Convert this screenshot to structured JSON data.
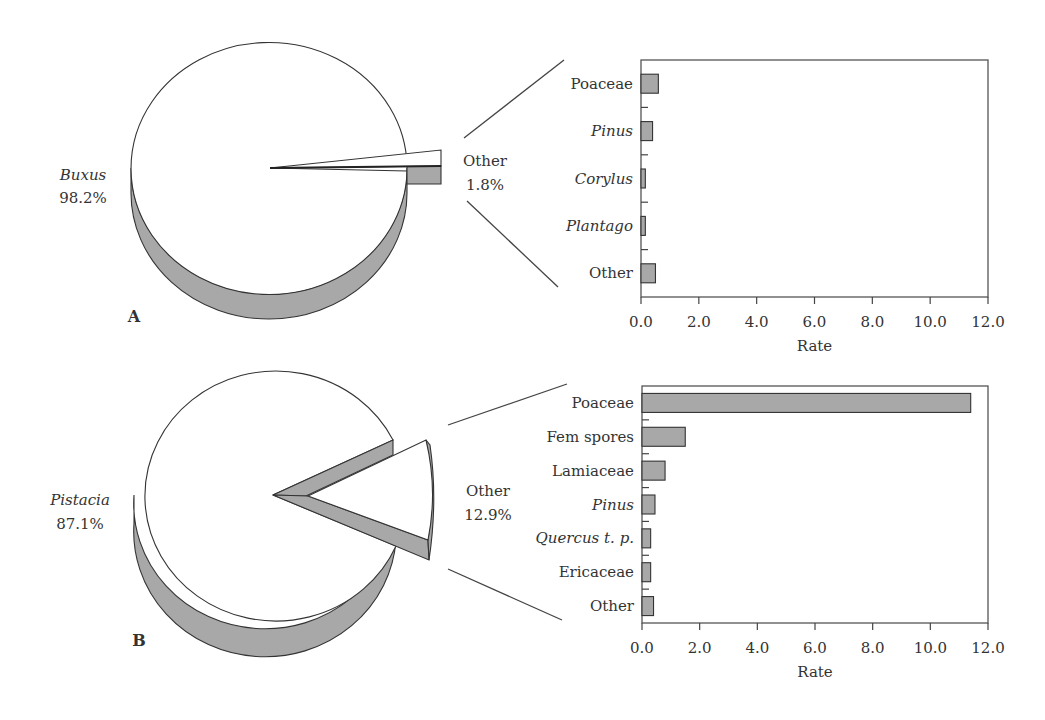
{
  "figure": {
    "panels": [
      {
        "letter": "A",
        "pie": {
          "main_label": "Buxus",
          "main_pct": "98.2%",
          "other_label": "Other",
          "other_pct": "1.8%"
        },
        "bar": {
          "xlabel": "Rate",
          "ticks": [
            "0.0",
            "2.0",
            "4.0",
            "6.0",
            "8.0",
            "10.0",
            "12.0"
          ],
          "categories": [
            {
              "label": "Poaceae",
              "italic": false,
              "value": 0.6
            },
            {
              "label": "Pinus",
              "italic": true,
              "value": 0.4
            },
            {
              "label": "Corylus",
              "italic": true,
              "value": 0.15
            },
            {
              "label": "Plantago",
              "italic": true,
              "value": 0.15
            },
            {
              "label": "Other",
              "italic": false,
              "value": 0.5
            }
          ]
        }
      },
      {
        "letter": "B",
        "pie": {
          "main_label": "Pistacia",
          "main_pct": "87.1%",
          "other_label": "Other",
          "other_pct": "12.9%"
        },
        "bar": {
          "xlabel": "Rate",
          "ticks": [
            "0.0",
            "2.0",
            "4.0",
            "6.0",
            "8.0",
            "10.0",
            "12.0"
          ],
          "categories": [
            {
              "label": "Poaceae",
              "italic": false,
              "value": 11.4
            },
            {
              "label": "Fem spores",
              "italic": false,
              "value": 1.5
            },
            {
              "label": "Lamiaceae",
              "italic": false,
              "value": 0.8
            },
            {
              "label": "Pinus",
              "italic": true,
              "value": 0.45
            },
            {
              "label": "Quercus t. p.",
              "italic": true,
              "value": 0.3
            },
            {
              "label": "Ericaceae",
              "italic": false,
              "value": 0.3
            },
            {
              "label": "Other",
              "italic": false,
              "value": 0.4
            }
          ]
        }
      }
    ]
  },
  "colors": {
    "bar_fill": "#a8a8a8",
    "pie_side": "#a8a8a8",
    "pie_top": "#ffffff",
    "stroke": "#333333"
  },
  "chart_data": [
    {
      "type": "pie",
      "title": "A",
      "labels": [
        "Buxus",
        "Other"
      ],
      "values": [
        98.2,
        1.8
      ],
      "exploded": [
        "Other"
      ]
    },
    {
      "type": "bar",
      "orientation": "horizontal",
      "title": "A — breakdown of Other (1.8%)",
      "categories": [
        "Poaceae",
        "Pinus",
        "Corylus",
        "Plantago",
        "Other"
      ],
      "values": [
        0.6,
        0.4,
        0.15,
        0.15,
        0.5
      ],
      "xlabel": "Rate",
      "ylabel": "",
      "xlim": [
        0,
        12
      ],
      "xticks": [
        0,
        2,
        4,
        6,
        8,
        10,
        12
      ],
      "grid": false
    },
    {
      "type": "pie",
      "title": "B",
      "labels": [
        "Pistacia",
        "Other"
      ],
      "values": [
        87.1,
        12.9
      ],
      "exploded": [
        "Other"
      ]
    },
    {
      "type": "bar",
      "orientation": "horizontal",
      "title": "B — breakdown of Other (12.9%)",
      "categories": [
        "Poaceae",
        "Fem spores",
        "Lamiaceae",
        "Pinus",
        "Quercus t. p.",
        "Ericaceae",
        "Other"
      ],
      "values": [
        11.4,
        1.5,
        0.8,
        0.45,
        0.3,
        0.3,
        0.4
      ],
      "xlabel": "Rate",
      "ylabel": "",
      "xlim": [
        0,
        12
      ],
      "xticks": [
        0,
        2,
        4,
        6,
        8,
        10,
        12
      ],
      "grid": false
    }
  ]
}
